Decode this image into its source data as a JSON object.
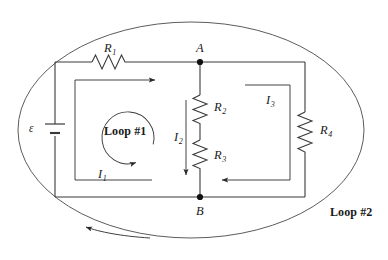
{
  "diagram": {
    "type": "circuit-schematic",
    "stroke_color": "#3a3a3a",
    "text_color": "#1a1a1a",
    "background": "#ffffff"
  },
  "components": {
    "source": {
      "symbol": "ε",
      "name": "battery-emf"
    },
    "resistors": [
      {
        "id": "R1",
        "letter": "R",
        "subscript": "1",
        "position": "top-branch"
      },
      {
        "id": "R2",
        "letter": "R",
        "subscript": "2",
        "position": "middle-branch-upper"
      },
      {
        "id": "R3",
        "letter": "R",
        "subscript": "3",
        "position": "middle-branch-lower"
      },
      {
        "id": "R4",
        "letter": "R",
        "subscript": "4",
        "position": "right-branch"
      }
    ]
  },
  "nodes": [
    {
      "id": "A",
      "label": "A",
      "position": "top-middle"
    },
    {
      "id": "B",
      "label": "B",
      "position": "bottom-middle"
    }
  ],
  "currents": [
    {
      "id": "I1",
      "letter": "I",
      "subscript": "1",
      "direction": "right",
      "mesh": "left"
    },
    {
      "id": "I2",
      "letter": "I",
      "subscript": "2",
      "direction": "down",
      "mesh": "middle"
    },
    {
      "id": "I3",
      "letter": "I",
      "subscript": "3",
      "direction": "left",
      "mesh": "right"
    }
  ],
  "loops": [
    {
      "id": "loop1",
      "label": "Loop #1",
      "direction": "clockwise",
      "shape": "circle-arrow"
    },
    {
      "id": "loop2",
      "label": "Loop #2",
      "direction": "counterclockwise",
      "shape": "ellipse-arrow"
    }
  ]
}
